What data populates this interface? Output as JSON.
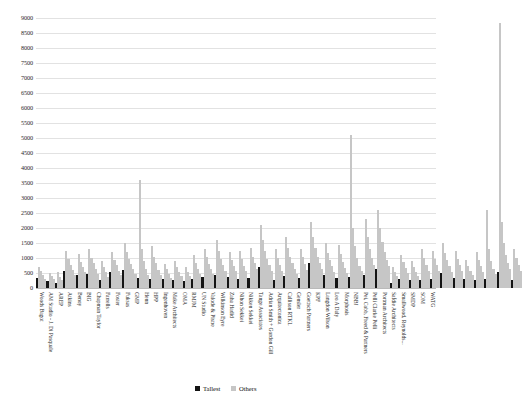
{
  "chart_data": {
    "type": "bar",
    "title": "",
    "subtitle": "",
    "xlabel": "",
    "ylabel": "",
    "ylim": [
      0,
      9000
    ],
    "ytick_step": 500,
    "yticks": [
      "0",
      "500",
      "1000",
      "1500",
      "2000",
      "2500",
      "3000",
      "3500",
      "4000",
      "4500",
      "5000",
      "5500",
      "6000",
      "6500",
      "7000",
      "7500",
      "8000",
      "8500",
      "9000"
    ],
    "grid": true,
    "legend_position": "bottom-center",
    "legend": [
      "Tallest",
      "Others"
    ],
    "colors": {
      "tallest": "#141414",
      "others": "#c6c6c6",
      "gridline": "#e2e2e2",
      "background": "#ffffff"
    },
    "categories": [
      "Woods Bagot",
      "AM Studio - J. Di Pasquale",
      "AREP",
      "Atkins",
      "Benoy",
      "BIG",
      "Chapman Taylor",
      "Farrells",
      "Foster",
      "Fuksas",
      "GMP",
      "Henn",
      "HPP",
      "Ingenhoven",
      "Make Architects",
      "OMA",
      "RMJM",
      "UN Studio",
      "Valode & Pistre",
      "Wilkinson Eyre",
      "Zaha Hadid",
      "Nihon Sekkei",
      "Nikken Sekkei",
      "Tange Associates",
      "Adrian Smith + Gordon Gill",
      "Arquitectonica",
      "Callison RTKL",
      "Gensler",
      "Goettsch Partners",
      "KPF",
      "Langdon Wilson",
      "Leo A Daly",
      "Morphosis",
      "NBBJ",
      "Pei, Cobb, Freed & Partners",
      "Pelli Clarke Pelli",
      "Portman Architects",
      "Safdie Architects",
      "Smallwood, Reynolds...",
      "SMDP",
      "SOM",
      "WATG"
    ],
    "series": [
      {
        "name": "Tallest",
        "color": "#141414",
        "values": [
          320,
          230,
          180,
          560,
          430,
          470,
          280,
          540,
          600,
          330,
          300,
          290,
          260,
          250,
          290,
          360,
          440,
          380,
          300,
          340,
          700,
          260,
          390,
          350,
          820,
          430,
          330,
          380,
          440,
          640,
          180,
          290,
          260,
          280,
          300,
          490,
          350,
          290,
          260,
          310,
          540,
          280
        ]
      },
      {
        "name": "Others",
        "color": "#c6c6c6",
        "values_max": [
          700,
          500,
          520,
          1250,
          1150,
          1300,
          900,
          1200,
          1500,
          3600,
          1400,
          800,
          900,
          700,
          1100,
          1300,
          1600,
          1200,
          1250,
          1350,
          2100,
          1300,
          1700,
          1300,
          2200,
          1500,
          1450,
          5100,
          2300,
          2600,
          700,
          1100,
          900,
          1300,
          1250,
          1500,
          1250,
          950,
          1200,
          2600,
          8850,
          1300
        ]
      }
    ],
    "bar_groups": [
      {
        "category": "Woods Bagot",
        "tallest": 320,
        "others": [
          700,
          560,
          420,
          300
        ]
      },
      {
        "category": "AM Studio - J. Di Pasquale",
        "tallest": 230,
        "others": [
          500,
          400,
          300
        ]
      },
      {
        "category": "AREP",
        "tallest": 180,
        "others": [
          520,
          380,
          260
        ]
      },
      {
        "category": "Atkins",
        "tallest": 560,
        "others": [
          1250,
          980,
          760,
          600,
          450
        ]
      },
      {
        "category": "Benoy",
        "tallest": 430,
        "others": [
          1150,
          880,
          700,
          520
        ]
      },
      {
        "category": "BIG",
        "tallest": 470,
        "others": [
          1300,
          1000,
          820,
          640,
          480
        ]
      },
      {
        "category": "Chapman Taylor",
        "tallest": 280,
        "others": [
          900,
          700,
          540,
          380
        ]
      },
      {
        "category": "Farrells",
        "tallest": 540,
        "others": [
          1200,
          950,
          760,
          580,
          420
        ]
      },
      {
        "category": "Foster",
        "tallest": 600,
        "others": [
          1500,
          1200,
          980,
          800,
          620,
          480
        ]
      },
      {
        "category": "Fuksas",
        "tallest": 330,
        "others": [
          3600,
          1300,
          900,
          620,
          440
        ]
      },
      {
        "category": "GMP",
        "tallest": 300,
        "others": [
          1400,
          1050,
          820,
          600,
          440
        ]
      },
      {
        "category": "Henn",
        "tallest": 290,
        "others": [
          800,
          620,
          460,
          340
        ]
      },
      {
        "category": "HPP",
        "tallest": 260,
        "others": [
          900,
          700,
          540,
          400
        ]
      },
      {
        "category": "Ingenhoven",
        "tallest": 250,
        "others": [
          700,
          540,
          400
        ]
      },
      {
        "category": "Make Architects",
        "tallest": 290,
        "others": [
          1100,
          840,
          640,
          470
        ]
      },
      {
        "category": "OMA",
        "tallest": 360,
        "others": [
          1300,
          1020,
          800,
          620,
          460
        ]
      },
      {
        "category": "RMJM",
        "tallest": 440,
        "others": [
          1600,
          1250,
          980,
          760,
          580
        ]
      },
      {
        "category": "UN Studio",
        "tallest": 380,
        "others": [
          1200,
          940,
          740,
          560
        ]
      },
      {
        "category": "Valode & Pistre",
        "tallest": 300,
        "others": [
          1250,
          960,
          740,
          560
        ]
      },
      {
        "category": "Wilkinson Eyre",
        "tallest": 340,
        "others": [
          1350,
          1050,
          820,
          620
        ]
      },
      {
        "category": "Zaha Hadid",
        "tallest": 700,
        "others": [
          2100,
          1600,
          1250,
          980,
          760,
          580
        ]
      },
      {
        "category": "Nihon Sekkei",
        "tallest": 260,
        "others": [
          1300,
          1000,
          780,
          580
        ]
      },
      {
        "category": "Nikken Sekkei",
        "tallest": 390,
        "others": [
          1700,
          1350,
          1050,
          820,
          620,
          460
        ]
      },
      {
        "category": "Tange Associates",
        "tallest": 350,
        "others": [
          1300,
          1020,
          800,
          600
        ]
      },
      {
        "category": "Adrian Smith + Gordon Gill",
        "tallest": 820,
        "others": [
          2200,
          1700,
          1350,
          1050,
          820,
          620
        ]
      },
      {
        "category": "Arquitectonica",
        "tallest": 430,
        "others": [
          1500,
          1180,
          920,
          720,
          540
        ]
      },
      {
        "category": "Callison RTKL",
        "tallest": 330,
        "others": [
          1450,
          1120,
          880,
          680,
          500
        ]
      },
      {
        "category": "Gensler",
        "tallest": 380,
        "others": [
          5100,
          2000,
          1400,
          1000,
          750,
          560
        ]
      },
      {
        "category": "Goettsch Partners",
        "tallest": 440,
        "others": [
          2300,
          1700,
          1300,
          1000,
          760
        ]
      },
      {
        "category": "KPF",
        "tallest": 640,
        "others": [
          2600,
          2000,
          1550,
          1200,
          940,
          720
        ]
      },
      {
        "category": "Langdon Wilson",
        "tallest": 180,
        "others": [
          700,
          540,
          400
        ]
      },
      {
        "category": "Leo A Daly",
        "tallest": 290,
        "others": [
          1100,
          860,
          660,
          500
        ]
      },
      {
        "category": "Morphosis",
        "tallest": 260,
        "others": [
          900,
          700,
          540,
          400
        ]
      },
      {
        "category": "NBBJ",
        "tallest": 280,
        "others": [
          1300,
          1000,
          780,
          580
        ]
      },
      {
        "category": "Pei, Cobb, Freed & Partners",
        "tallest": 300,
        "others": [
          1250,
          980,
          760,
          580
        ]
      },
      {
        "category": "Pelli Clarke Pelli",
        "tallest": 490,
        "others": [
          1500,
          1180,
          920,
          720,
          540
        ]
      },
      {
        "category": "Portman Architects",
        "tallest": 350,
        "others": [
          1250,
          980,
          760,
          580
        ]
      },
      {
        "category": "Safdie Architects",
        "tallest": 290,
        "others": [
          950,
          740,
          570,
          420
        ]
      },
      {
        "category": "Smallwood, Reynolds...",
        "tallest": 260,
        "others": [
          1200,
          940,
          730,
          550
        ]
      },
      {
        "category": "SMDP",
        "tallest": 310,
        "others": [
          2600,
          1300,
          900,
          650,
          480
        ]
      },
      {
        "category": "SOM",
        "tallest": 540,
        "others": [
          8850,
          2200,
          1500,
          1100,
          850,
          640
        ]
      },
      {
        "category": "WATG",
        "tallest": 280,
        "others": [
          1300,
          1000,
          780,
          580
        ]
      }
    ]
  }
}
